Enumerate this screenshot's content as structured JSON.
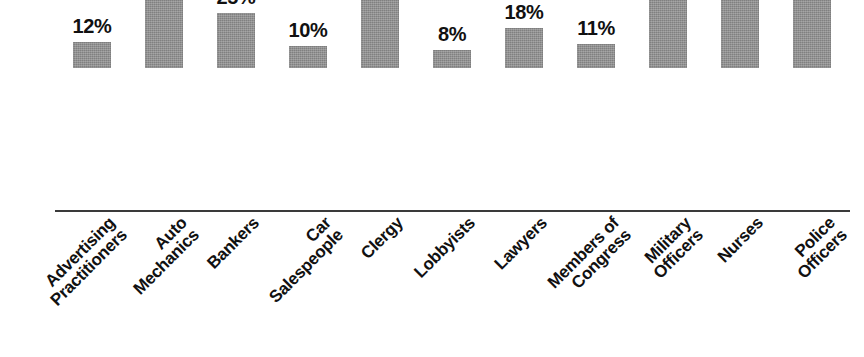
{
  "chart_data": {
    "type": "bar",
    "title": "",
    "subtitle": "",
    "xlabel": "",
    "ylabel": "",
    "ylim": [
      0,
      100
    ],
    "grid": false,
    "legend": "none",
    "value_suffix": "%",
    "categories": [
      "Advertising Practitioners",
      "Auto Mechanics",
      "Bankers",
      "Car Salespeople",
      "Clergy",
      "Lobbyists",
      "Lawyers",
      "Members of Congress",
      "Military Officers",
      "Nurses",
      "Police Officers"
    ],
    "category_lines": [
      [
        "Advertising",
        "Practitioners"
      ],
      [
        "Auto",
        "Mechanics"
      ],
      [
        "Bankers"
      ],
      [
        "Car",
        "Salespeople"
      ],
      [
        "Clergy"
      ],
      [
        "Lobbyists"
      ],
      [
        "Lawyers"
      ],
      [
        "Members of",
        "Congress"
      ],
      [
        "Military",
        "Officers"
      ],
      [
        "Nurses"
      ],
      [
        "Police",
        "Officers"
      ]
    ],
    "values": [
      12,
      32,
      25,
      10,
      42,
      8,
      18,
      11,
      71,
      82,
      56
    ],
    "value_labels": [
      "12%",
      "32%",
      "25%",
      "10%",
      "42%",
      "8%",
      "18%",
      "11%",
      "71%",
      "82%",
      "56%"
    ],
    "bar_color": "#8d8d8d",
    "axis_color": "#3a3a3a",
    "label_color": "#111111",
    "background": "#ffffff"
  },
  "layout": {
    "bar_width_px": 38,
    "bar_spacing_px": 72,
    "first_bar_left_px": 73,
    "baseline_y_px": 211,
    "px_per_percent": 2.2,
    "label_rotation_deg": -45
  }
}
